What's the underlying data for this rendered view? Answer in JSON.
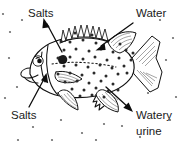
{
  "diagram": {
    "background_color": "#ffffff",
    "ink_color": "#111111",
    "width": 182,
    "height": 148
  },
  "labels": [
    {
      "id": "salts-top",
      "text": "Salts",
      "position": "top-left",
      "x": 28,
      "y": 13,
      "direction": "out",
      "arrow_from": [
        62,
        52
      ],
      "arrow_to": [
        45,
        22
      ],
      "arrow_name": "salts-out-arrow"
    },
    {
      "id": "water-top",
      "text": "Water",
      "position": "top-right",
      "x": 137,
      "y": 13,
      "direction": "in",
      "arrow_from": [
        131,
        24
      ],
      "arrow_to": [
        98,
        48
      ],
      "arrow_name": "water-in-arrow"
    },
    {
      "id": "salts-bottom",
      "text": "Salts",
      "position": "bottom-left",
      "x": 12,
      "y": 113,
      "direction": "in",
      "arrow_from": [
        30,
        105
      ],
      "arrow_to": [
        44,
        76
      ],
      "arrow_name": "salts-in-arrow"
    },
    {
      "id": "watery-urine",
      "text": "Watery",
      "text_line2": "urine",
      "position": "bottom-right",
      "x": 137,
      "y": 114,
      "y2": 130,
      "direction": "out",
      "arrow_from": [
        107,
        88
      ],
      "arrow_to": [
        131,
        110
      ],
      "arrow_name": "watery-urine-arrow"
    }
  ],
  "particles": {
    "inside_label": "water and salt particles inside body",
    "outside_label": "water particles in surrounding medium",
    "inside_color": "#2b2b2b",
    "outside_color": "#6e6e6e",
    "inside": [
      [
        70,
        42
      ],
      [
        83,
        40
      ],
      [
        96,
        43
      ],
      [
        108,
        41
      ],
      [
        120,
        44
      ],
      [
        64,
        50
      ],
      [
        76,
        49
      ],
      [
        89,
        51
      ],
      [
        101,
        49
      ],
      [
        113,
        52
      ],
      [
        126,
        50
      ],
      [
        58,
        58
      ],
      [
        70,
        57
      ],
      [
        83,
        59
      ],
      [
        95,
        57
      ],
      [
        107,
        60
      ],
      [
        119,
        58
      ],
      [
        131,
        60
      ],
      [
        64,
        66
      ],
      [
        76,
        65
      ],
      [
        88,
        67
      ],
      [
        100,
        65
      ],
      [
        112,
        68
      ],
      [
        124,
        66
      ],
      [
        58,
        74
      ],
      [
        70,
        73
      ],
      [
        82,
        75
      ],
      [
        94,
        73
      ],
      [
        106,
        76
      ],
      [
        118,
        74
      ],
      [
        65,
        82
      ],
      [
        77,
        81
      ],
      [
        89,
        83
      ],
      [
        101,
        81
      ],
      [
        113,
        84
      ],
      [
        72,
        89
      ],
      [
        84,
        90
      ],
      [
        96,
        88
      ],
      [
        108,
        91
      ],
      [
        80,
        96
      ],
      [
        92,
        95
      ],
      [
        104,
        97
      ],
      [
        61,
        41
      ],
      [
        133,
        53
      ],
      [
        127,
        73
      ],
      [
        118,
        90
      ],
      [
        75,
        33
      ],
      [
        92,
        35
      ]
    ],
    "outside": [
      [
        10,
        32
      ],
      [
        22,
        20
      ],
      [
        9,
        58
      ],
      [
        5,
        98
      ],
      [
        17,
        87
      ],
      [
        33,
        127
      ],
      [
        61,
        120
      ],
      [
        82,
        133
      ],
      [
        104,
        124
      ],
      [
        122,
        126
      ],
      [
        148,
        93
      ],
      [
        166,
        60
      ],
      [
        173,
        38
      ],
      [
        160,
        20
      ],
      [
        176,
        97
      ],
      [
        140,
        137
      ],
      [
        96,
        140
      ],
      [
        52,
        140
      ],
      [
        18,
        140
      ],
      [
        3,
        14
      ],
      [
        170,
        120
      ],
      [
        152,
        46
      ]
    ]
  }
}
